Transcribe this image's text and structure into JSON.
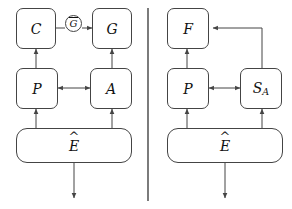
{
  "figure": {
    "type": "block-diagram",
    "panels": 2,
    "divider": "vertical-rule",
    "stroke_color": "#444444",
    "text_color": "#111111",
    "background_color": "#ffffff"
  },
  "left_panel": {
    "name": "left-panel",
    "nodes": {
      "c": {
        "label": "C",
        "shape": "rounded-box",
        "row": "top"
      },
      "gbar": {
        "label": "G",
        "accent": "bar",
        "shape": "circle",
        "row": "top"
      },
      "g": {
        "label": "G",
        "shape": "rounded-box",
        "row": "top"
      },
      "p": {
        "label": "P",
        "shape": "rounded-box",
        "row": "middle"
      },
      "a": {
        "label": "A",
        "shape": "rounded-box",
        "row": "middle"
      },
      "e": {
        "label": "E",
        "accent": "hat",
        "shape": "rounded-box-wide",
        "row": "bottom"
      }
    },
    "edges": [
      {
        "from": "c",
        "to": "gbar",
        "head": "none"
      },
      {
        "from": "gbar",
        "to": "g",
        "head": "single"
      },
      {
        "from": "p",
        "to": "c",
        "head": "single"
      },
      {
        "from": "a",
        "to": "g",
        "head": "single"
      },
      {
        "from": "p",
        "to": "a",
        "head": "double"
      },
      {
        "from": "e",
        "to": "p",
        "head": "single"
      },
      {
        "from": "e",
        "to": "a",
        "head": "single"
      },
      {
        "from": "e",
        "to": "output",
        "head": "single"
      }
    ]
  },
  "right_panel": {
    "name": "right-panel",
    "nodes": {
      "f": {
        "label": "F",
        "shape": "rounded-box",
        "row": "top"
      },
      "p": {
        "label": "P",
        "shape": "rounded-box",
        "row": "middle"
      },
      "sa": {
        "label": "S",
        "subscript": "A",
        "shape": "rounded-box",
        "row": "middle"
      },
      "e": {
        "label": "E",
        "accent": "hat",
        "shape": "rounded-box-wide",
        "row": "bottom"
      }
    },
    "edges": [
      {
        "from": "p",
        "to": "f",
        "head": "single"
      },
      {
        "from": "sa",
        "to": "f",
        "head": "single",
        "routing": "up-then-left"
      },
      {
        "from": "p",
        "to": "sa",
        "head": "double"
      },
      {
        "from": "e",
        "to": "p",
        "head": "single"
      },
      {
        "from": "e",
        "to": "sa",
        "head": "single"
      },
      {
        "from": "e",
        "to": "output",
        "head": "single"
      }
    ]
  }
}
